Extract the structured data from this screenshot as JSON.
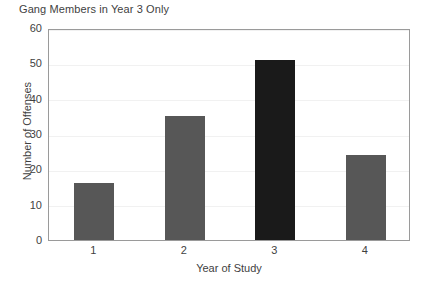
{
  "chart_data": {
    "type": "bar",
    "title": "Gang Members in Year 3 Only",
    "xlabel": "Year of Study",
    "ylabel": "Number of Offenses",
    "categories": [
      "1",
      "2",
      "3",
      "4"
    ],
    "values": [
      16,
      35,
      51,
      24
    ],
    "bar_colors": [
      "#575757",
      "#575757",
      "#1a1a1a",
      "#575757"
    ],
    "highlighted_category": "3",
    "ylim": [
      0,
      60
    ],
    "y_ticks": [
      0,
      10,
      20,
      30,
      40,
      50,
      60
    ],
    "y_tick_labels": [
      "0",
      "10",
      "20",
      "30",
      "40",
      "50",
      "60"
    ],
    "grid": true,
    "grid_axis": "y",
    "legend": false,
    "series": [
      {
        "name": "Number of Offenses",
        "values": [
          16,
          35,
          51,
          24
        ]
      }
    ]
  },
  "style": {
    "frame_color": "#9a9a9a",
    "grid_color": "#f1f1f1",
    "text_color": "#3f3f3f",
    "background": "#ffffff",
    "bar_gray": "#575757",
    "bar_dark": "#1a1a1a"
  }
}
